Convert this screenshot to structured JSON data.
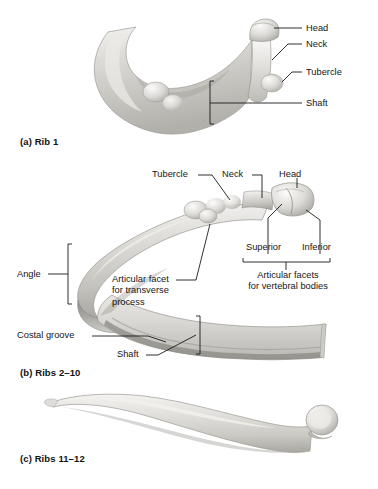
{
  "figure": {
    "background_color": "#ffffff",
    "bone_color": "#d6d4d0",
    "leader_color": "#1a1a1a"
  },
  "panels": [
    {
      "id": "a",
      "caption": "(a) Rib 1",
      "subject": "first-rib",
      "labels": [
        {
          "name": "head",
          "text": "Head"
        },
        {
          "name": "neck",
          "text": "Neck"
        },
        {
          "name": "tubercle",
          "text": "Tubercle"
        },
        {
          "name": "shaft",
          "text": "Shaft"
        }
      ]
    },
    {
      "id": "b",
      "caption": "(b) Ribs 2–10",
      "subject": "typical-rib",
      "labels": [
        {
          "name": "tubercle",
          "text": "Tubercle"
        },
        {
          "name": "neck",
          "text": "Neck"
        },
        {
          "name": "head",
          "text": "Head"
        },
        {
          "name": "superior",
          "text": "Superior"
        },
        {
          "name": "inferior",
          "text": "Inferior"
        },
        {
          "name": "articular-facets-vertebral-bodies",
          "line1": "Articular facets",
          "line2": "for vertebral bodies"
        },
        {
          "name": "articular-facet-transverse-process",
          "line1": "Articular facet",
          "line2": "for transverse",
          "line3": "process"
        },
        {
          "name": "angle",
          "text": "Angle"
        },
        {
          "name": "costal-groove",
          "text": "Costal groove"
        },
        {
          "name": "shaft",
          "text": "Shaft"
        }
      ]
    },
    {
      "id": "c",
      "caption": "(c) Ribs 11–12",
      "subject": "floating-rib",
      "labels": []
    }
  ]
}
